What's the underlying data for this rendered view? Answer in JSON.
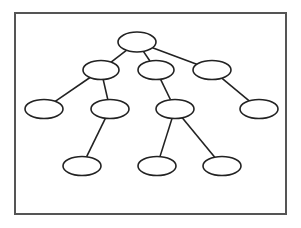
{
  "diagram": {
    "type": "tree",
    "frame": {
      "x": 15,
      "y": 13,
      "width": 271,
      "height": 201,
      "stroke": "#555555",
      "stroke_width": 2
    },
    "style": {
      "node_stroke": "#222222",
      "node_fill": "#ffffff",
      "edge_stroke": "#222222",
      "stroke_width": 1.6
    },
    "nodes": [
      {
        "id": "n0",
        "level": 0,
        "cx": 137,
        "cy": 42,
        "rx": 19,
        "ry": 10
      },
      {
        "id": "n1",
        "level": 1,
        "cx": 101,
        "cy": 70,
        "rx": 18,
        "ry": 9.5
      },
      {
        "id": "n2",
        "level": 1,
        "cx": 156,
        "cy": 70,
        "rx": 18,
        "ry": 9.5
      },
      {
        "id": "n3",
        "level": 1,
        "cx": 212,
        "cy": 70,
        "rx": 19,
        "ry": 9.5
      },
      {
        "id": "n4",
        "level": 2,
        "cx": 44,
        "cy": 109,
        "rx": 19,
        "ry": 9.5
      },
      {
        "id": "n5",
        "level": 2,
        "cx": 110,
        "cy": 109,
        "rx": 19,
        "ry": 9.5
      },
      {
        "id": "n6",
        "level": 2,
        "cx": 175,
        "cy": 109,
        "rx": 19,
        "ry": 9.5
      },
      {
        "id": "n7",
        "level": 2,
        "cx": 259,
        "cy": 109,
        "rx": 19,
        "ry": 9.5
      },
      {
        "id": "n8",
        "level": 3,
        "cx": 82,
        "cy": 166,
        "rx": 19,
        "ry": 9.5
      },
      {
        "id": "n9",
        "level": 3,
        "cx": 157,
        "cy": 166,
        "rx": 19,
        "ry": 9.5
      },
      {
        "id": "n10",
        "level": 3,
        "cx": 222,
        "cy": 166,
        "rx": 19,
        "ry": 9.5
      }
    ],
    "edges": [
      {
        "from": "n0",
        "to": "n1"
      },
      {
        "from": "n0",
        "to": "n2"
      },
      {
        "from": "n0",
        "to": "n3"
      },
      {
        "from": "n1",
        "to": "n4"
      },
      {
        "from": "n1",
        "to": "n5"
      },
      {
        "from": "n2",
        "to": "n6"
      },
      {
        "from": "n3",
        "to": "n7"
      },
      {
        "from": "n5",
        "to": "n8"
      },
      {
        "from": "n6",
        "to": "n9"
      },
      {
        "from": "n6",
        "to": "n10"
      }
    ]
  }
}
